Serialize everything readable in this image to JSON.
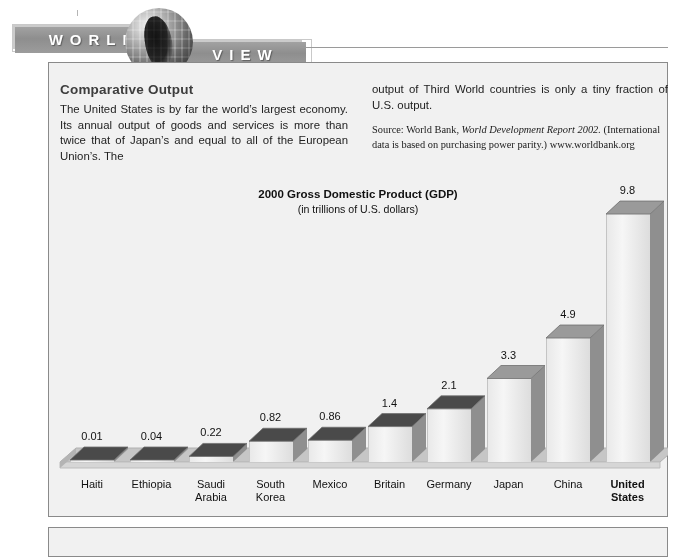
{
  "banner": {
    "word_1": "WORLD",
    "word_2": "VIEW",
    "globe_icon": "globe-icon"
  },
  "article": {
    "headline": "Comparative Output",
    "paragraph_left": "The United States is by far the world’s largest economy. Its annual output of goods and services is more than twice that of Japan’s and equal to all of the European Union’s. The",
    "paragraph_right": "output of Third World countries is only a tiny fraction of U.S. output.",
    "source_prefix": "Source: World Bank, ",
    "source_italic": "World Development Report 2002.",
    "source_suffix": " (International data is based on purchasing power parity.) www.worldbank.org"
  },
  "chart_data": {
    "type": "bar",
    "title": "2000 Gross Domestic Product (GDP)",
    "subtitle": "(in trillions of U.S. dollars)",
    "xlabel": "",
    "ylabel": "",
    "ylim": [
      0,
      9.8
    ],
    "grid": false,
    "legend": "none",
    "categories": [
      "Haiti",
      "Ethiopia",
      "Saudi Arabia",
      "South Korea",
      "Mexico",
      "Britain",
      "Germany",
      "Japan",
      "China",
      "United States"
    ],
    "category_lines": [
      [
        "Haiti"
      ],
      [
        "Ethiopia"
      ],
      [
        "Saudi",
        "Arabia"
      ],
      [
        "South",
        "Korea"
      ],
      [
        "Mexico"
      ],
      [
        "Britain"
      ],
      [
        "Germany"
      ],
      [
        "Japan"
      ],
      [
        "China"
      ],
      [
        "United",
        "States"
      ]
    ],
    "values": [
      0.01,
      0.04,
      0.22,
      0.82,
      0.86,
      1.4,
      2.1,
      3.3,
      4.9,
      9.8
    ],
    "value_labels": [
      "0.01",
      "0.04",
      "0.22",
      "0.82",
      "0.86",
      "1.4",
      "2.1",
      "3.3",
      "4.9",
      "9.8"
    ],
    "highlight_category": "United States"
  },
  "colors": {
    "banner_bar": "#8e8e8e",
    "panel_background": "#f1f1f1",
    "panel_border": "#8a8a8a",
    "bar_top_face": "#4a4a4a",
    "bar_side_face": "#8f8f8f",
    "bar_front_face": "#ededed",
    "ground_face": "#c3c3c3",
    "text": "#111111"
  }
}
